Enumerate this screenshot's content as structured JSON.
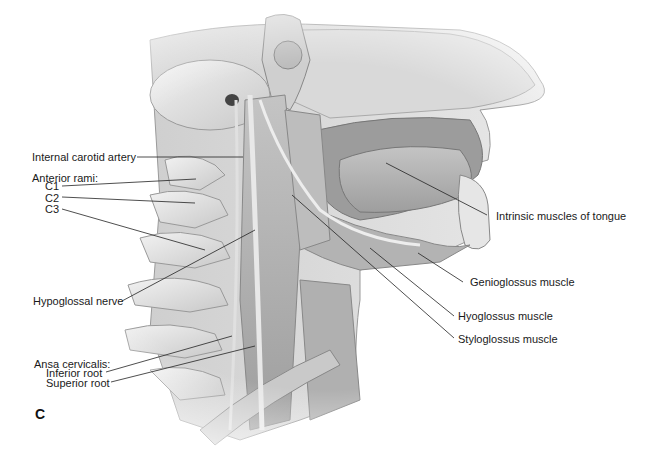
{
  "figure": {
    "panel_letter": "C",
    "background": "#ffffff",
    "illustration_tones": {
      "bone": "#e4e4e4",
      "muscle": "#b9b9b9",
      "dark": "#8a8a8a",
      "skin": "#d6d6d6",
      "line": "#222222"
    },
    "labels_left": [
      {
        "id": "internal-carotid-artery",
        "text": "Internal carotid artery"
      },
      {
        "id": "anterior-rami",
        "text": "Anterior rami:"
      },
      {
        "id": "c1",
        "text": "C1"
      },
      {
        "id": "c2",
        "text": "C2"
      },
      {
        "id": "c3",
        "text": "C3"
      },
      {
        "id": "hypoglossal-nerve",
        "text": "Hypoglossal nerve"
      },
      {
        "id": "ansa-cervicalis",
        "text": "Ansa cervicalis:"
      },
      {
        "id": "inferior-root",
        "text": "Inferior root"
      },
      {
        "id": "superior-root",
        "text": "Superior root"
      }
    ],
    "labels_right": [
      {
        "id": "intrinsic-muscles",
        "text": "Intrinsic muscles of tongue"
      },
      {
        "id": "genioglossus",
        "text": "Genioglossus muscle"
      },
      {
        "id": "hyoglossus",
        "text": "Hyoglossus muscle"
      },
      {
        "id": "styloglossus",
        "text": "Styloglossus muscle"
      }
    ]
  }
}
